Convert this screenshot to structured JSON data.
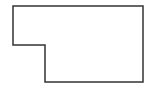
{
  "diagram": {
    "type": "polygon-outline",
    "shape": "L-shaped rectilinear polygon",
    "canvas": {
      "width": 149,
      "height": 95,
      "background": "#ffffff"
    },
    "stroke_color": "#333333",
    "stroke_width": 1.5,
    "fill": "none",
    "vertices": [
      [
        13,
        6
      ],
      [
        143,
        6
      ],
      [
        143,
        82
      ],
      [
        45,
        82
      ],
      [
        45,
        45
      ],
      [
        13,
        45
      ]
    ]
  }
}
